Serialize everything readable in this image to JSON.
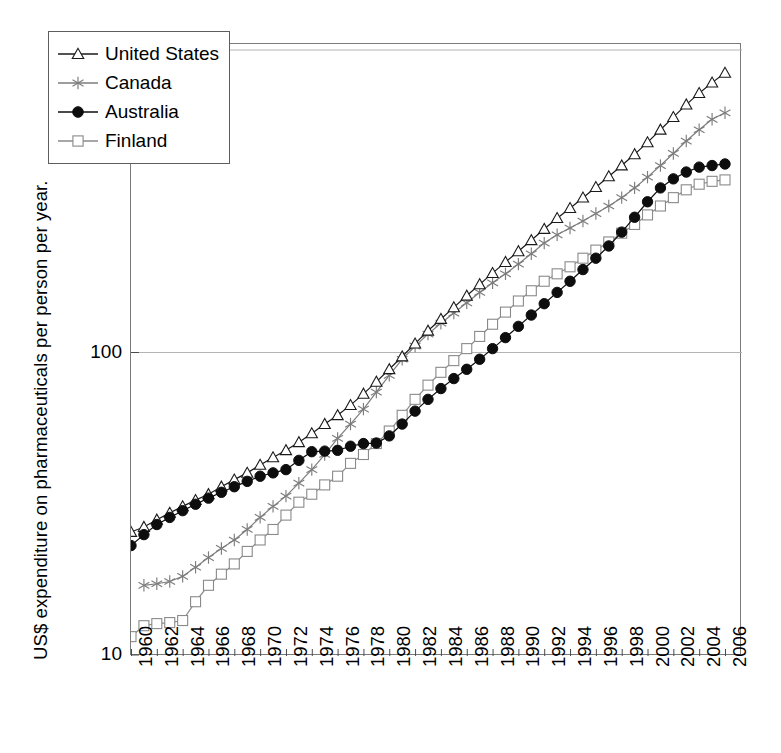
{
  "chart_data": {
    "type": "line",
    "title": "",
    "subtitle": "",
    "xlabel": "",
    "ylabel": "US$ expenditure on  pharmaceuticals per person per year.",
    "scale": {
      "x": "linear",
      "y": "log"
    },
    "xlim": [
      1960,
      2006
    ],
    "ylim": [
      10,
      1000
    ],
    "grid": "horizontal-major-only",
    "legend_position": "upper-left-inside",
    "y_ticks": [
      "10",
      "100",
      "1000"
    ],
    "y_tick_values": [
      10,
      100,
      1000
    ],
    "x_ticks": [
      "1960",
      "1962",
      "1964",
      "1966",
      "1968",
      "1970",
      "1972",
      "1974",
      "1976",
      "1978",
      "1980",
      "1982",
      "1984",
      "1986",
      "1988",
      "1990",
      "1992",
      "1994",
      "1996",
      "1998",
      "2000",
      "2002",
      "2004",
      "2006"
    ],
    "x_tick_values": [
      1960,
      1962,
      1964,
      1966,
      1968,
      1970,
      1972,
      1974,
      1976,
      1978,
      1980,
      1982,
      1984,
      1986,
      1988,
      1990,
      1992,
      1994,
      1996,
      1998,
      2000,
      2002,
      2004,
      2006
    ],
    "x": [
      1960,
      1961,
      1962,
      1963,
      1964,
      1965,
      1966,
      1967,
      1968,
      1969,
      1970,
      1971,
      1972,
      1973,
      1974,
      1975,
      1976,
      1977,
      1978,
      1979,
      1980,
      1981,
      1982,
      1983,
      1984,
      1985,
      1986,
      1987,
      1988,
      1989,
      1990,
      1991,
      1992,
      1993,
      1994,
      1995,
      1996,
      1997,
      1998,
      1999,
      2000,
      2001,
      2002,
      2003,
      2004,
      2005,
      2006
    ],
    "series": [
      {
        "name": "United States",
        "marker": "open-triangle",
        "color": "#1a1a1a",
        "values": [
          25.5,
          26.5,
          28,
          29.5,
          31,
          32.5,
          34,
          36,
          38,
          40,
          42.5,
          45,
          47.5,
          50.5,
          54,
          58,
          62,
          67,
          73,
          80,
          88,
          97,
          107,
          118,
          129,
          141,
          154,
          168,
          183,
          199,
          216,
          235,
          256,
          278,
          300,
          325,
          352,
          382,
          415,
          452,
          495,
          545,
          600,
          660,
          720,
          780,
          840
        ]
      },
      {
        "name": "Canada",
        "marker": "asterisk",
        "color": "#7d7d7d",
        "values": [
          null,
          17,
          17.2,
          17.5,
          18.2,
          19.5,
          21,
          22.5,
          24,
          26,
          28.5,
          31,
          33.5,
          37,
          41,
          46,
          52,
          58,
          65,
          74,
          84,
          95,
          105,
          115,
          125,
          135,
          146,
          158,
          170,
          182,
          196,
          212,
          230,
          245,
          258,
          272,
          288,
          305,
          325,
          350,
          380,
          415,
          455,
          500,
          545,
          590,
          620
        ]
      },
      {
        "name": "Australia",
        "marker": "filled-circle",
        "color": "#0d0d0d",
        "values": [
          23,
          25,
          27,
          28.5,
          30,
          31.5,
          33,
          34.5,
          36,
          37.5,
          39,
          40,
          41,
          44,
          47,
          47.2,
          47.5,
          49,
          50,
          50.2,
          53,
          58,
          64,
          70,
          76,
          82,
          88,
          95,
          103,
          112,
          122,
          133,
          145,
          158,
          172,
          188,
          205,
          225,
          250,
          280,
          315,
          350,
          375,
          395,
          410,
          415,
          420
        ]
      },
      {
        "name": "Finland",
        "marker": "open-square",
        "color": "#8a8a8a",
        "values": [
          11.5,
          12.5,
          12.7,
          12.8,
          13,
          15,
          17,
          18.5,
          20,
          22,
          24,
          26,
          29,
          32,
          34,
          36.5,
          39,
          43,
          46,
          50,
          55,
          62,
          70,
          78,
          86,
          94,
          103,
          113,
          124,
          136,
          148,
          160,
          172,
          182,
          192,
          205,
          218,
          232,
          248,
          265,
          285,
          305,
          325,
          345,
          360,
          368,
          372
        ]
      }
    ]
  },
  "legend": {
    "items": [
      {
        "label": "United States",
        "marker": "open-triangle",
        "color": "#1a1a1a"
      },
      {
        "label": "Canada",
        "marker": "asterisk",
        "color": "#7d7d7d"
      },
      {
        "label": "Australia",
        "marker": "filled-circle",
        "color": "#0d0d0d"
      },
      {
        "label": "Finland",
        "marker": "open-square",
        "color": "#8a8a8a"
      }
    ]
  },
  "axes": {
    "y_title": "US$ expenditure on  pharmaceuticals per person per year.",
    "gridline_color": "#b4b4b4",
    "frame_color": "#7b7b7b"
  }
}
